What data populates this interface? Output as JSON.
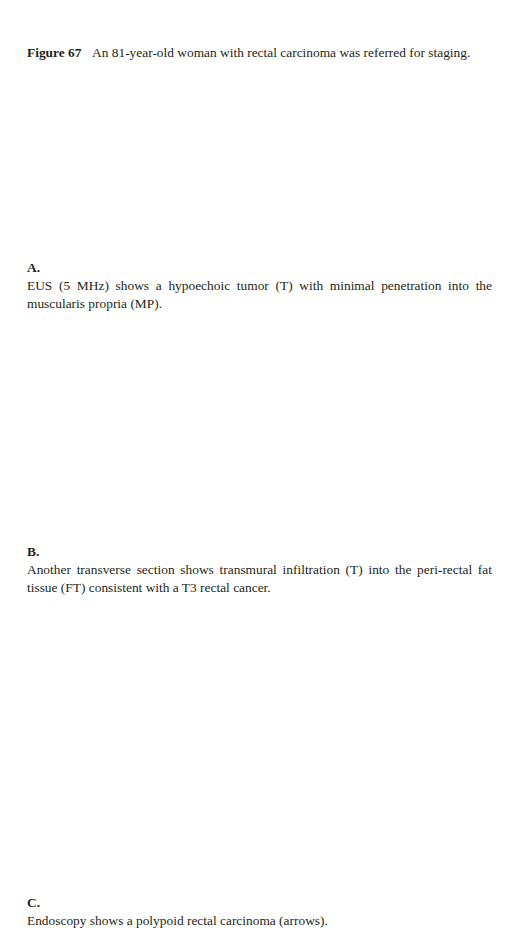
{
  "figure": {
    "label": "Figure 67",
    "caption": "An 81-year-old woman with rectal carcinoma was referred for staging."
  },
  "subfigures": [
    {
      "label": "A.",
      "caption": "EUS (5 MHz) shows a hypoechoic tumor (T) with minimal penetration into the muscularis propria (MP)."
    },
    {
      "label": "B.",
      "caption": "Another transverse section shows transmural infiltration (T) into the peri-rectal fat tissue (FT) consistent with a T3 rectal cancer."
    },
    {
      "label": "C.",
      "caption": "Endoscopy shows a polypoid rectal carcinoma (arrows)."
    }
  ]
}
